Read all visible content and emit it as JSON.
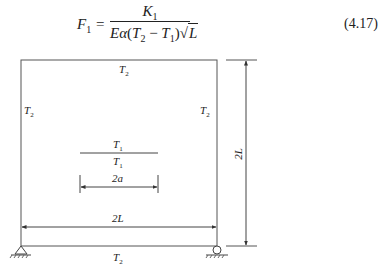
{
  "equation": {
    "lhs_symbol": "F",
    "lhs_sub": "1",
    "equals": "=",
    "numerator_symbol": "K",
    "numerator_sub": "1",
    "denominator": {
      "E": "E",
      "alpha": "α",
      "open": "(",
      "T2": "T",
      "T2_sub": "2",
      "minus": " − ",
      "T1": "T",
      "T1_sub": "1",
      "close": ")",
      "sqrt": "√",
      "L": "L"
    },
    "number": "(4.17)"
  },
  "diagram": {
    "top_label": "T",
    "top_sub": "2",
    "left_label": "T",
    "left_sub": "2",
    "right_label": "T",
    "right_sub": "2",
    "bottom_label": "T",
    "bottom_sub": "2",
    "crack_top_label": "T",
    "crack_top_sub": "1",
    "crack_bottom_label": "T",
    "crack_bottom_sub": "1",
    "crack_length_label": "2a",
    "width_label": "2L",
    "height_label": "2L",
    "left_support": "pin-support",
    "right_support": "roller-support"
  }
}
